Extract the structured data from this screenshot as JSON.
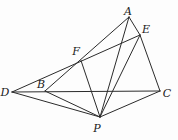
{
  "diagram": {
    "width": 178,
    "height": 140,
    "background_color": "#fdfdfd",
    "line_color": "#2b2b2b",
    "line_width": 1,
    "label_color": "#1a1a1a",
    "points": {
      "A": {
        "label": "A",
        "x": 129,
        "y": 17,
        "label_x": 128,
        "label_y": 15
      },
      "E": {
        "label": "E",
        "x": 140,
        "y": 35,
        "label_x": 146,
        "label_y": 33
      },
      "F": {
        "label": "F",
        "x": 81,
        "y": 60.5,
        "label_x": 76,
        "label_y": 55
      },
      "D": {
        "label": "D",
        "x": 12,
        "y": 92,
        "label_x": 5,
        "label_y": 96
      },
      "B": {
        "label": "B",
        "x": 45,
        "y": 91,
        "label_x": 41,
        "label_y": 88
      },
      "C": {
        "label": "C",
        "x": 160,
        "y": 91,
        "label_x": 167,
        "label_y": 97
      },
      "P": {
        "label": "P",
        "x": 100,
        "y": 117,
        "label_x": 97,
        "label_y": 132
      }
    },
    "segments": [
      [
        "D",
        "C"
      ],
      [
        "D",
        "E"
      ],
      [
        "D",
        "P"
      ],
      [
        "B",
        "A"
      ],
      [
        "B",
        "P"
      ],
      [
        "A",
        "E"
      ],
      [
        "A",
        "P"
      ],
      [
        "E",
        "C"
      ],
      [
        "E",
        "P"
      ],
      [
        "C",
        "P"
      ],
      [
        "F",
        "P"
      ]
    ]
  }
}
